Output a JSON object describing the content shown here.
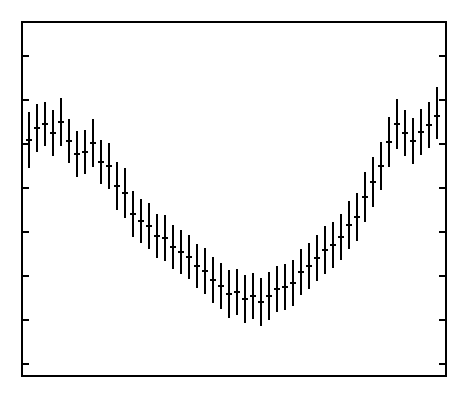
{
  "figure": {
    "background_color": "#ffffff",
    "foreground_color": "#000000",
    "width": 472,
    "height": 401
  },
  "axes": {
    "frame": {
      "left": 22,
      "top": 22,
      "right": 446,
      "bottom": 376
    },
    "frame_line_width": 2,
    "tick_direction": "in",
    "tick_length": 7,
    "tick_line_width": 2,
    "left_axis_ticks_y": [
      56,
      100,
      144,
      188,
      232,
      276,
      320,
      364
    ],
    "right_axis_ticks_y": [
      56,
      100,
      144,
      188,
      232,
      276,
      320,
      364
    ],
    "bottom_axis_ticks": [],
    "top_axis_ticks": [],
    "tick_labels": [],
    "xlabel": "",
    "ylabel": "",
    "title": ""
  },
  "chart_data": {
    "type": "scatter",
    "style": "errorbar",
    "title": "",
    "subtitle": "",
    "xlabel": "",
    "ylabel": "",
    "grid": false,
    "legend": null,
    "legend_position": "none",
    "marker": "horizontal-center-tick",
    "error_bar_direction": "vertical",
    "xlim": [
      0,
      52
    ],
    "ylim_pixels": [
      22,
      376
    ],
    "x_axis_note": "unlabeled index axis; points evenly spaced",
    "y_axis_note": "unlabeled; values given in plot pixel coordinates, smaller pixel y = larger value",
    "n_points": 52,
    "x": [
      1,
      2,
      3,
      4,
      5,
      6,
      7,
      8,
      9,
      10,
      11,
      12,
      13,
      14,
      15,
      16,
      17,
      18,
      19,
      20,
      21,
      22,
      23,
      24,
      25,
      26,
      27,
      28,
      29,
      30,
      31,
      32,
      33,
      34,
      35,
      36,
      37,
      38,
      39,
      40,
      41,
      42,
      43,
      44,
      45,
      46,
      47,
      48,
      49,
      50,
      51,
      52
    ],
    "points": [
      {
        "x": 1,
        "cx": 29,
        "y": 140,
        "lo": 168,
        "hi": 112
      },
      {
        "x": 2,
        "cx": 37,
        "y": 128,
        "lo": 152,
        "hi": 104
      },
      {
        "x": 3,
        "cx": 45,
        "y": 124,
        "lo": 146,
        "hi": 102
      },
      {
        "x": 4,
        "cx": 53,
        "y": 133,
        "lo": 156,
        "hi": 110
      },
      {
        "x": 5,
        "cx": 61,
        "y": 122,
        "lo": 146,
        "hi": 98
      },
      {
        "x": 6,
        "cx": 69,
        "y": 141,
        "lo": 163,
        "hi": 119
      },
      {
        "x": 7,
        "cx": 77,
        "y": 154,
        "lo": 177,
        "hi": 131
      },
      {
        "x": 8,
        "cx": 85,
        "y": 152,
        "lo": 174,
        "hi": 130
      },
      {
        "x": 9,
        "cx": 93,
        "y": 143,
        "lo": 167,
        "hi": 119
      },
      {
        "x": 10,
        "cx": 101,
        "y": 162,
        "lo": 184,
        "hi": 140
      },
      {
        "x": 11,
        "cx": 109,
        "y": 166,
        "lo": 189,
        "hi": 143
      },
      {
        "x": 12,
        "cx": 117,
        "y": 186,
        "lo": 210,
        "hi": 162
      },
      {
        "x": 13,
        "cx": 125,
        "y": 193,
        "lo": 218,
        "hi": 168
      },
      {
        "x": 14,
        "cx": 133,
        "y": 214,
        "lo": 237,
        "hi": 191
      },
      {
        "x": 15,
        "cx": 141,
        "y": 221,
        "lo": 243,
        "hi": 199
      },
      {
        "x": 16,
        "cx": 149,
        "y": 226,
        "lo": 249,
        "hi": 203
      },
      {
        "x": 17,
        "cx": 157,
        "y": 236,
        "lo": 258,
        "hi": 214
      },
      {
        "x": 18,
        "cx": 165,
        "y": 238,
        "lo": 261,
        "hi": 215
      },
      {
        "x": 19,
        "cx": 173,
        "y": 247,
        "lo": 269,
        "hi": 225
      },
      {
        "x": 20,
        "cx": 181,
        "y": 252,
        "lo": 274,
        "hi": 230
      },
      {
        "x": 21,
        "cx": 189,
        "y": 257,
        "lo": 279,
        "hi": 235
      },
      {
        "x": 22,
        "cx": 197,
        "y": 266,
        "lo": 288,
        "hi": 244
      },
      {
        "x": 23,
        "cx": 205,
        "y": 271,
        "lo": 294,
        "hi": 248
      },
      {
        "x": 24,
        "cx": 213,
        "y": 280,
        "lo": 303,
        "hi": 257
      },
      {
        "x": 25,
        "cx": 221,
        "y": 286,
        "lo": 309,
        "hi": 263
      },
      {
        "x": 26,
        "cx": 229,
        "y": 294,
        "lo": 318,
        "hi": 270
      },
      {
        "x": 27,
        "cx": 237,
        "y": 292,
        "lo": 315,
        "hi": 269
      },
      {
        "x": 28,
        "cx": 245,
        "y": 299,
        "lo": 323,
        "hi": 275
      },
      {
        "x": 29,
        "cx": 253,
        "y": 296,
        "lo": 319,
        "hi": 273
      },
      {
        "x": 30,
        "cx": 261,
        "y": 302,
        "lo": 326,
        "hi": 278
      },
      {
        "x": 31,
        "cx": 269,
        "y": 296,
        "lo": 320,
        "hi": 272
      },
      {
        "x": 32,
        "cx": 277,
        "y": 289,
        "lo": 312,
        "hi": 266
      },
      {
        "x": 33,
        "cx": 285,
        "y": 287,
        "lo": 310,
        "hi": 264
      },
      {
        "x": 34,
        "cx": 293,
        "y": 283,
        "lo": 306,
        "hi": 260
      },
      {
        "x": 35,
        "cx": 301,
        "y": 272,
        "lo": 295,
        "hi": 249
      },
      {
        "x": 36,
        "cx": 309,
        "y": 266,
        "lo": 289,
        "hi": 243
      },
      {
        "x": 37,
        "cx": 317,
        "y": 258,
        "lo": 281,
        "hi": 235
      },
      {
        "x": 38,
        "cx": 325,
        "y": 250,
        "lo": 274,
        "hi": 226
      },
      {
        "x": 39,
        "cx": 333,
        "y": 245,
        "lo": 268,
        "hi": 222
      },
      {
        "x": 40,
        "cx": 341,
        "y": 237,
        "lo": 260,
        "hi": 214
      },
      {
        "x": 41,
        "cx": 349,
        "y": 225,
        "lo": 249,
        "hi": 201
      },
      {
        "x": 42,
        "cx": 357,
        "y": 217,
        "lo": 241,
        "hi": 193
      },
      {
        "x": 43,
        "cx": 365,
        "y": 197,
        "lo": 222,
        "hi": 172
      },
      {
        "x": 44,
        "cx": 373,
        "y": 182,
        "lo": 207,
        "hi": 157
      },
      {
        "x": 45,
        "cx": 381,
        "y": 166,
        "lo": 190,
        "hi": 142
      },
      {
        "x": 46,
        "cx": 389,
        "y": 142,
        "lo": 167,
        "hi": 117
      },
      {
        "x": 47,
        "cx": 397,
        "y": 124,
        "lo": 149,
        "hi": 99
      },
      {
        "x": 48,
        "cx": 405,
        "y": 133,
        "lo": 156,
        "hi": 110
      },
      {
        "x": 49,
        "cx": 413,
        "y": 141,
        "lo": 164,
        "hi": 118
      },
      {
        "x": 50,
        "cx": 421,
        "y": 132,
        "lo": 155,
        "hi": 109
      },
      {
        "x": 51,
        "cx": 429,
        "y": 125,
        "lo": 148,
        "hi": 102
      },
      {
        "x": 52,
        "cx": 437,
        "y": 116,
        "lo": 139,
        "hi": 87
      }
    ]
  }
}
